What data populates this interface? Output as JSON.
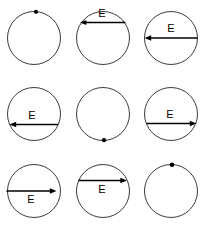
{
  "figure": {
    "type": "diagram",
    "grid": {
      "columns": 3,
      "rows": 3
    },
    "style": {
      "background_color": "#ffffff",
      "circle_stroke_color": "#3a3a3a",
      "arrow_color": "#000000",
      "dot_color": "#000000",
      "label_color": "#000000"
    },
    "cells": [
      {
        "id": "cell-1",
        "row": 1,
        "column": 1,
        "shape": "circle",
        "marker": "dot",
        "marker_position": "top",
        "arrow": null,
        "label": ""
      },
      {
        "id": "cell-2",
        "row": 1,
        "column": 2,
        "shape": "circle",
        "marker": null,
        "arrow": {
          "direction": "left",
          "chord": "upper",
          "label_side": "above"
        },
        "label": "E"
      },
      {
        "id": "cell-3",
        "row": 1,
        "column": 3,
        "shape": "circle",
        "marker": null,
        "arrow": {
          "direction": "left",
          "chord": "diameter",
          "label_side": "above"
        },
        "label": "E"
      },
      {
        "id": "cell-4",
        "row": 2,
        "column": 1,
        "shape": "circle",
        "marker": null,
        "arrow": {
          "direction": "left",
          "chord": "lower",
          "label_side": "above"
        },
        "label": "E"
      },
      {
        "id": "cell-5",
        "row": 2,
        "column": 2,
        "shape": "circle",
        "marker": "dot",
        "marker_position": "bottom",
        "arrow": null,
        "label": ""
      },
      {
        "id": "cell-6",
        "row": 2,
        "column": 3,
        "shape": "circle",
        "marker": null,
        "arrow": {
          "direction": "right",
          "chord": "lower",
          "label_side": "above"
        },
        "label": "E"
      },
      {
        "id": "cell-7",
        "row": 3,
        "column": 1,
        "shape": "circle",
        "marker": null,
        "arrow": {
          "direction": "right",
          "chord": "diameter",
          "label_side": "below"
        },
        "label": "E"
      },
      {
        "id": "cell-8",
        "row": 3,
        "column": 2,
        "shape": "circle",
        "marker": null,
        "arrow": {
          "direction": "right",
          "chord": "upper",
          "label_side": "below"
        },
        "label": "E"
      },
      {
        "id": "cell-9",
        "row": 3,
        "column": 3,
        "shape": "circle",
        "marker": "dot",
        "marker_position": "top",
        "arrow": null,
        "label": ""
      }
    ]
  }
}
